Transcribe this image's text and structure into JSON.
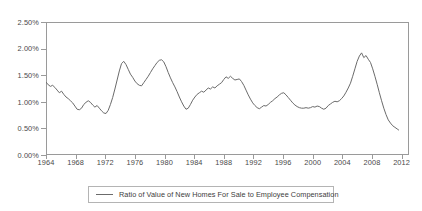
{
  "chart_data": {
    "type": "line",
    "title": "",
    "xlabel": "",
    "ylabel": "",
    "ylim": [
      0.0,
      2.5
    ],
    "xlim": [
      1964,
      2013
    ],
    "grid": false,
    "legend_position": "bottom",
    "y_tick_labels": [
      "2.50%",
      "2.00%",
      "1.50%",
      "1.00%",
      "0.50%",
      "0.00%"
    ],
    "y_tick_values": [
      2.5,
      2.0,
      1.5,
      1.0,
      0.5,
      0.0
    ],
    "x_tick_labels": [
      "1964",
      "1968",
      "1972",
      "1976",
      "1980",
      "1984",
      "1988",
      "1992",
      "1996",
      "2000",
      "2004",
      "2008",
      "2012"
    ],
    "x_tick_values": [
      1964,
      1968,
      1972,
      1976,
      1980,
      1984,
      1988,
      1992,
      1996,
      2000,
      2004,
      2008,
      2012
    ],
    "series": [
      {
        "name": "Ratio of Value of New Homes For Sale to Employee Compensation",
        "color": "#6b6b6b",
        "units": "percent",
        "x": [
          1964.0,
          1964.3,
          1964.6,
          1964.9,
          1965.2,
          1965.5,
          1965.8,
          1966.1,
          1966.4,
          1966.7,
          1967.0,
          1967.3,
          1967.6,
          1967.9,
          1968.2,
          1968.5,
          1968.8,
          1969.1,
          1969.4,
          1969.7,
          1970.0,
          1970.3,
          1970.6,
          1970.9,
          1971.2,
          1971.5,
          1971.8,
          1972.1,
          1972.4,
          1972.7,
          1973.0,
          1973.3,
          1973.6,
          1973.9,
          1974.2,
          1974.5,
          1974.8,
          1975.1,
          1975.4,
          1975.7,
          1976.0,
          1976.3,
          1976.6,
          1976.9,
          1977.2,
          1977.5,
          1977.8,
          1978.1,
          1978.4,
          1978.7,
          1979.0,
          1979.3,
          1979.6,
          1979.9,
          1980.2,
          1980.5,
          1980.8,
          1981.1,
          1981.4,
          1981.7,
          1982.0,
          1982.3,
          1982.6,
          1982.9,
          1983.2,
          1983.5,
          1983.8,
          1984.1,
          1984.4,
          1984.7,
          1985.0,
          1985.3,
          1985.6,
          1985.9,
          1986.2,
          1986.5,
          1986.8,
          1987.1,
          1987.4,
          1987.7,
          1988.0,
          1988.3,
          1988.6,
          1988.9,
          1989.2,
          1989.5,
          1989.8,
          1990.1,
          1990.4,
          1990.7,
          1991.0,
          1991.3,
          1991.6,
          1991.9,
          1992.2,
          1992.5,
          1992.8,
          1993.1,
          1993.4,
          1993.7,
          1994.0,
          1994.3,
          1994.6,
          1994.9,
          1995.2,
          1995.5,
          1995.8,
          1996.1,
          1996.4,
          1996.7,
          1997.0,
          1997.3,
          1997.6,
          1997.9,
          1998.2,
          1998.5,
          1998.8,
          1999.1,
          1999.4,
          1999.7,
          2000.0,
          2000.3,
          2000.6,
          2000.9,
          2001.2,
          2001.5,
          2001.8,
          2002.1,
          2002.4,
          2002.7,
          2003.0,
          2003.3,
          2003.6,
          2003.9,
          2004.2,
          2004.5,
          2004.8,
          2005.1,
          2005.4,
          2005.7,
          2006.0,
          2006.3,
          2006.6,
          2006.9,
          2007.2,
          2007.5,
          2007.8,
          2008.1,
          2008.4,
          2008.7,
          2009.0,
          2009.3,
          2009.6,
          2009.9,
          2010.2,
          2010.5,
          2010.8,
          2011.1,
          2011.4,
          2011.6
        ],
        "y": [
          1.37,
          1.32,
          1.29,
          1.31,
          1.27,
          1.22,
          1.17,
          1.2,
          1.14,
          1.09,
          1.06,
          1.02,
          0.98,
          0.92,
          0.86,
          0.85,
          0.88,
          0.95,
          0.99,
          1.02,
          0.99,
          0.94,
          0.9,
          0.93,
          0.88,
          0.83,
          0.79,
          0.78,
          0.84,
          0.95,
          1.08,
          1.24,
          1.41,
          1.58,
          1.72,
          1.76,
          1.7,
          1.61,
          1.52,
          1.46,
          1.39,
          1.34,
          1.31,
          1.3,
          1.36,
          1.42,
          1.48,
          1.55,
          1.62,
          1.68,
          1.74,
          1.78,
          1.79,
          1.75,
          1.66,
          1.55,
          1.45,
          1.36,
          1.28,
          1.19,
          1.09,
          1.0,
          0.92,
          0.86,
          0.88,
          0.95,
          1.03,
          1.09,
          1.14,
          1.17,
          1.2,
          1.18,
          1.22,
          1.26,
          1.24,
          1.28,
          1.26,
          1.3,
          1.33,
          1.36,
          1.42,
          1.47,
          1.44,
          1.48,
          1.44,
          1.41,
          1.42,
          1.43,
          1.38,
          1.31,
          1.22,
          1.13,
          1.05,
          0.98,
          0.93,
          0.89,
          0.87,
          0.9,
          0.93,
          0.92,
          0.95,
          0.99,
          1.02,
          1.06,
          1.09,
          1.13,
          1.16,
          1.17,
          1.13,
          1.08,
          1.03,
          0.98,
          0.94,
          0.91,
          0.89,
          0.88,
          0.88,
          0.89,
          0.88,
          0.89,
          0.91,
          0.9,
          0.92,
          0.91,
          0.88,
          0.86,
          0.88,
          0.93,
          0.96,
          0.99,
          1.01,
          1.0,
          1.02,
          1.06,
          1.11,
          1.18,
          1.26,
          1.35,
          1.48,
          1.62,
          1.76,
          1.86,
          1.92,
          1.83,
          1.87,
          1.8,
          1.74,
          1.62,
          1.48,
          1.33,
          1.17,
          1.02,
          0.88,
          0.76,
          0.66,
          0.6,
          0.55,
          0.52,
          0.49,
          0.47
        ]
      }
    ]
  },
  "legend": {
    "entries": [
      {
        "label": "Ratio of Value of New Homes For Sale to Employee Compensation",
        "color": "#6b6b6b"
      }
    ]
  },
  "colors": {
    "series_line": "#6b6b6b",
    "axis": "#9a9a9a",
    "tick_text": "#4a4a4a",
    "legend_border": "#b4b4b4",
    "background": "#ffffff"
  }
}
